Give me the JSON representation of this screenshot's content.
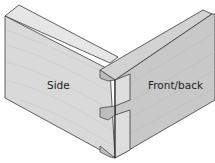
{
  "diagram": {
    "labels": {
      "side": "Side",
      "front_back": "Front/back"
    },
    "colors": {
      "background": "#ffffff",
      "side_face": "#d9d9d9",
      "side_top": "#e6e6e6",
      "front_face": "#c8c8c8",
      "front_top": "#d2d2d2",
      "end_grain": "#dedede",
      "tail_socket": "#bdbdbd",
      "outline": "#3a3a3a",
      "grain": "#bfbfbf"
    }
  }
}
